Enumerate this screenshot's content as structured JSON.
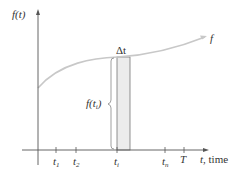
{
  "diagram": {
    "y_axis_label": "f(t)",
    "x_axis_label_var": "t",
    "x_axis_label_text": ", time",
    "curve_label": "f",
    "delta_label": "Δt",
    "bracket_label_main": "f(t",
    "bracket_label_sub": "i",
    "bracket_label_close": ")",
    "ticks": [
      {
        "main": "t",
        "sub": "1"
      },
      {
        "main": "t",
        "sub": "2"
      },
      {
        "main": "t",
        "sub": "i"
      },
      {
        "main": "t",
        "sub": "n"
      },
      {
        "main": "T",
        "sub": ""
      }
    ],
    "colors": {
      "curve": "#c8c8c8",
      "axis": "#555555",
      "rect_fill": "#ececec",
      "rect_stroke": "#777777"
    }
  }
}
